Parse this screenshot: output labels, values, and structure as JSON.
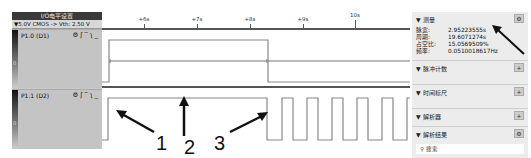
{
  "left_panel": {
    "header": "I/O电平设置",
    "level_setting": "▼5.0V CMOS -> Vth: 2.50 V",
    "channels": [
      {
        "label": "P1.0 (D1)",
        "zero_label": "0",
        "icons": [
          "gear-icon",
          "rising-edge-icon",
          "high-level-icon",
          "falling-edge-icon",
          "low-level-icon"
        ]
      },
      {
        "label": "P1.1 (D2)",
        "zero_label": "0",
        "icons": [
          "gear-icon",
          "rising-edge-icon",
          "high-level-icon",
          "falling-edge-icon",
          "low-level-icon"
        ]
      }
    ]
  },
  "timeline": {
    "ticks": [
      "+6s",
      "+7s",
      "+8s",
      "+9s",
      "10s"
    ]
  },
  "right_panel": {
    "measure": {
      "title": "▼ 测量",
      "rows": [
        {
          "key": "脉宽:",
          "value": "2.95223555s"
        },
        {
          "key": "周期:",
          "value": "19.6071274s"
        },
        {
          "key": "占空比:",
          "value": "15.0569509%"
        },
        {
          "key": "频率:",
          "value": "0.0510018617Hz"
        }
      ]
    },
    "sections": [
      {
        "title": "▼ 脉冲计数",
        "button": "+"
      },
      {
        "title": "▼ 时间标尺",
        "button": "+"
      },
      {
        "title": "▼ 解析器",
        "button": "+"
      },
      {
        "title": "▼ 解析结果",
        "button": "⚙"
      }
    ],
    "search_placeholder": "搜索"
  },
  "annotations": [
    "1",
    "2",
    "3"
  ]
}
